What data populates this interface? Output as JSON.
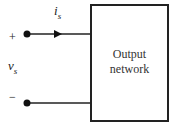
{
  "diagram": {
    "block": {
      "label_line1": "Output",
      "label_line2": "network"
    },
    "current": {
      "symbol": "i",
      "subscript": "s"
    },
    "voltage": {
      "symbol": "v",
      "subscript": "s"
    },
    "polarity": {
      "plus": "+",
      "minus": "−"
    },
    "colors": {
      "line": "#222222",
      "background": "#ffffff"
    }
  }
}
